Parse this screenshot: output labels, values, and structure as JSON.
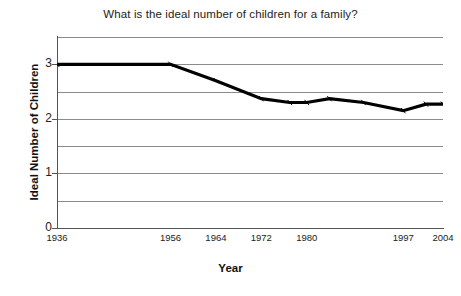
{
  "chart_data": {
    "type": "line",
    "title": "What is the ideal number of children for a family?",
    "xlabel": "Year",
    "ylabel": "Ideal Number of Children",
    "x": [
      1936,
      1956,
      1964,
      1972,
      1977,
      1980,
      1984,
      1990,
      1997,
      2001,
      2004
    ],
    "values": [
      3.0,
      3.0,
      2.7,
      2.37,
      2.3,
      2.3,
      2.37,
      2.3,
      2.15,
      2.27,
      2.27
    ],
    "series": [
      {
        "name": "Ideal Number of Children",
        "values": [
          3.0,
          3.0,
          2.7,
          2.37,
          2.3,
          2.3,
          2.37,
          2.3,
          2.15,
          2.27,
          2.27
        ]
      }
    ],
    "xtick_labels": [
      "1936",
      "1956",
      "1964",
      "1972",
      "1980",
      "1997",
      "2004"
    ],
    "xtick_values": [
      1936,
      1956,
      1964,
      1972,
      1980,
      1997,
      2004
    ],
    "ytick_labels": [
      "0",
      "1",
      "2",
      "3"
    ],
    "ytick_values": [
      0,
      1,
      2,
      3
    ],
    "gridline_values": [
      0.5,
      1.0,
      1.5,
      2.0,
      2.5,
      3.0,
      3.5
    ],
    "ylim": [
      0,
      3.5
    ],
    "xlim": [
      1936,
      2004
    ],
    "grid": true,
    "legend": "none",
    "line_color": "#000000",
    "grid_color": "#8a8a8a",
    "background_color": "#ffffff"
  }
}
